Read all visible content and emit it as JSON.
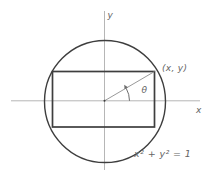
{
  "figure": {
    "labels": {
      "y_axis": "y",
      "x_axis": "x",
      "point": "(x, y)",
      "angle": "θ",
      "equation": "x² + y² = 1"
    },
    "colors": {
      "background": "#ffffff",
      "shape": "#3e3e3e",
      "axis": "#b6b6b6",
      "radius": "#8d8d8d",
      "angle": "#6d6d6d",
      "text": "#646464"
    }
  }
}
